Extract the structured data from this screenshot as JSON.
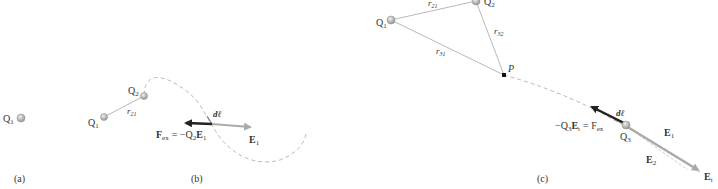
{
  "panels": {
    "a": {
      "caption": "(a)",
      "charge_label": "Q",
      "charge_sub": "1"
    },
    "b": {
      "caption": "(b)",
      "q1_label": "Q",
      "q1_sub": "1",
      "q2_label": "Q",
      "q2_sub": "2",
      "r_label": "r",
      "r_sub": "21",
      "dl_label": "dℓ",
      "fex_label": "F",
      "fex_sub": "ex",
      "fex_eq": "= −Q",
      "fex_eq_sub": "2",
      "fex_e": "E",
      "fex_e_sub": "1",
      "e1_label": "E",
      "e1_sub": "1"
    },
    "c": {
      "caption": "(c)",
      "q1_label": "Q",
      "q1_sub": "1",
      "q2_label": "Q",
      "q2_sub": "2",
      "q3_label": "Q",
      "q3_sub": "3",
      "p_label": "P",
      "r21_label": "r",
      "r21_sub": "21",
      "r32_label": "r",
      "r32_sub": "32",
      "r31_label": "r",
      "r31_sub": "31",
      "dl_label": "dℓ",
      "fex_lhs": "−Q",
      "fex_lhs_sub": "3",
      "fex_lhs_e": "E",
      "fex_lhs_e_sub": "t",
      "fex_eq": "= F",
      "fex_sub": "ex",
      "e1_label": "E",
      "e1_sub": "1",
      "e2_label": "E",
      "e2_sub": "2",
      "et_label": "E",
      "et_sub": "t"
    }
  },
  "colors": {
    "charge": "#b0b0b0",
    "line": "#999999",
    "dashed": "#bbbbbb",
    "force_arrow": "#222222",
    "field_arrow": "#aaaaaa",
    "text": "#333333"
  }
}
